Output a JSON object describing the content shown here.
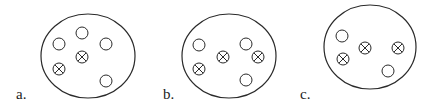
{
  "panels": [
    {
      "label": "a.",
      "label_pos": [
        16,
        99
      ],
      "boundary": {
        "cx": 88,
        "cy": 56,
        "rx": 47,
        "ry": 42
      },
      "open_particles": [
        [
          82,
          33
        ],
        [
          59,
          44
        ],
        [
          106,
          44
        ],
        [
          106,
          81
        ]
      ],
      "crossed_particles": [
        [
          82,
          57
        ],
        [
          59,
          69
        ]
      ]
    },
    {
      "label": "b.",
      "label_pos": [
        163,
        99
      ],
      "boundary": {
        "cx": 229,
        "cy": 56,
        "rx": 47,
        "ry": 42
      },
      "open_particles": [
        [
          199,
          45
        ],
        [
          246,
          44
        ],
        [
          246,
          80
        ]
      ],
      "crossed_particles": [
        [
          223,
          57
        ],
        [
          258,
          57
        ],
        [
          199,
          69
        ]
      ]
    },
    {
      "label": "c.",
      "label_pos": [
        300,
        99
      ],
      "boundary": {
        "cx": 370,
        "cy": 47,
        "rx": 46,
        "ry": 42
      },
      "open_particles": [
        [
          342,
          36
        ],
        [
          388,
          71
        ]
      ],
      "crossed_particles": [
        [
          365,
          48
        ],
        [
          398,
          48
        ],
        [
          343,
          59
        ]
      ]
    }
  ],
  "style": {
    "stroke": "#2a2a2a",
    "particle_radius": 6
  }
}
